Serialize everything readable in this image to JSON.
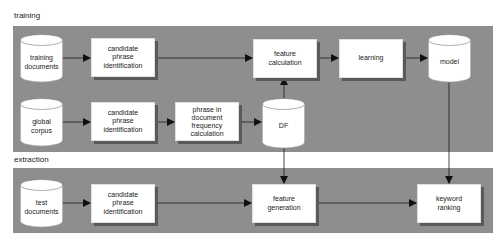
{
  "sections": {
    "training": {
      "label": "training"
    },
    "extraction": {
      "label": "extraction"
    }
  },
  "nodes": {
    "training_documents": {
      "type": "datastore",
      "label_lines": [
        "training",
        "documents"
      ]
    },
    "global_corpus": {
      "type": "datastore",
      "label_lines": [
        "global",
        "corpus"
      ]
    },
    "test_documents": {
      "type": "datastore",
      "label_lines": [
        "test",
        "documents"
      ]
    },
    "df": {
      "type": "datastore",
      "label_lines": [
        "DF"
      ]
    },
    "model": {
      "type": "datastore",
      "label_lines": [
        "model"
      ]
    },
    "candidate_phrase_identification_1": {
      "type": "process",
      "label_lines": [
        "candidate",
        "phrase",
        "identification"
      ]
    },
    "candidate_phrase_identification_2": {
      "type": "process",
      "label_lines": [
        "candidate",
        "phrase",
        "identification"
      ]
    },
    "candidate_phrase_identification_3": {
      "type": "process",
      "label_lines": [
        "candidate",
        "phrase",
        "identification"
      ]
    },
    "phrase_df_calculation": {
      "type": "process",
      "label_lines": [
        "phrase in",
        "document",
        "frequency",
        "calculation"
      ]
    },
    "feature_calculation": {
      "type": "process",
      "label_lines": [
        "feature",
        "calculation"
      ]
    },
    "learning": {
      "type": "process",
      "label_lines": [
        "learning"
      ]
    },
    "feature_generation": {
      "type": "process",
      "label_lines": [
        "feature",
        "generation"
      ]
    },
    "keyword_ranking": {
      "type": "process",
      "label_lines": [
        "keyword",
        "ranking"
      ]
    }
  },
  "edges": [
    [
      "training_documents",
      "candidate_phrase_identification_1"
    ],
    [
      "candidate_phrase_identification_1",
      "feature_calculation"
    ],
    [
      "feature_calculation",
      "learning"
    ],
    [
      "learning",
      "model"
    ],
    [
      "global_corpus",
      "candidate_phrase_identification_2"
    ],
    [
      "candidate_phrase_identification_2",
      "phrase_df_calculation"
    ],
    [
      "phrase_df_calculation",
      "df"
    ],
    [
      "df",
      "feature_calculation"
    ],
    [
      "df",
      "feature_generation"
    ],
    [
      "test_documents",
      "candidate_phrase_identification_3"
    ],
    [
      "candidate_phrase_identification_3",
      "feature_generation"
    ],
    [
      "feature_generation",
      "keyword_ranking"
    ],
    [
      "model",
      "keyword_ranking"
    ]
  ],
  "colors": {
    "panel": "#8e8e8e",
    "box": "#ffffff",
    "shadow": "#5a5a5a",
    "line": "#1a1a1a"
  }
}
